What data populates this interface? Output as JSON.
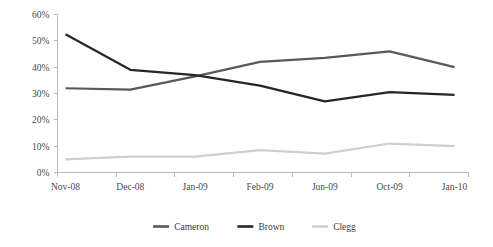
{
  "chart_data": {
    "type": "line",
    "title": "",
    "subtitle": "",
    "xlabel": "",
    "ylabel": "",
    "categories": [
      "Nov-08",
      "Dec-08",
      "Jan-09",
      "Feb-09",
      "Jun-09",
      "Oct-09",
      "Jan-10"
    ],
    "ylim": [
      0,
      60
    ],
    "yticks": [
      0,
      10,
      20,
      30,
      40,
      50,
      60
    ],
    "ytick_labels": [
      "0%",
      "10%",
      "20%",
      "30%",
      "40%",
      "50%",
      "60%"
    ],
    "grid": false,
    "legend_position": "bottom",
    "series": [
      {
        "name": "Cameron",
        "color": "#595959",
        "width": 2.2,
        "values": [
          32,
          31.5,
          36.5,
          42,
          43.5,
          46,
          40
        ]
      },
      {
        "name": "Brown",
        "color": "#262626",
        "width": 2.2,
        "values": [
          52.5,
          39,
          37,
          33,
          27,
          30.5,
          29.5
        ]
      },
      {
        "name": "Clegg",
        "color": "#cfcfcf",
        "width": 2.2,
        "values": [
          5,
          6,
          6,
          8.5,
          7.2,
          11,
          10
        ]
      }
    ]
  },
  "axis": {
    "line_color": "#b9b9b9",
    "tick_color": "#b9b9b9"
  },
  "legend": {
    "entries": [
      {
        "label": "Cameron",
        "color": "#595959"
      },
      {
        "label": "Brown",
        "color": "#262626"
      },
      {
        "label": "Clegg",
        "color": "#cfcfcf"
      }
    ]
  }
}
